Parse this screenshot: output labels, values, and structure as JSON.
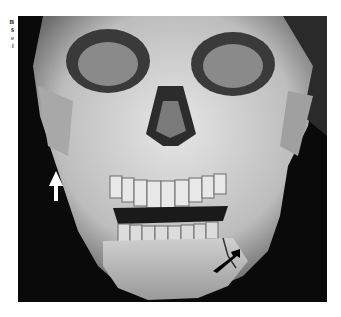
{
  "figure": {
    "margin_text_fragments": [
      "n",
      "s",
      "e",
      "f"
    ],
    "annotations": [
      {
        "name": "white-arrow",
        "color": "#ffffff",
        "direction": "up"
      },
      {
        "name": "black-arrow",
        "color": "#000000",
        "direction": "down-left"
      }
    ],
    "colors": {
      "background": "#0a0a0a",
      "bone": "#d8d8d8"
    }
  }
}
